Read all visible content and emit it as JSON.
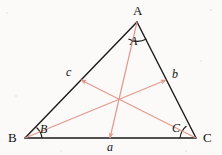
{
  "figure": {
    "background_color": "#fbfaf8",
    "stroke_color": "#1a1a1a",
    "median_color": "#e09a8e",
    "label_color": "#111111",
    "median_label_color": "#111111"
  },
  "vertices": {
    "A": {
      "label": "A",
      "x": 137,
      "y": 22,
      "label_x": 133,
      "label_y": 4
    },
    "B": {
      "label": "B",
      "x": 25,
      "y": 138,
      "label_x": 8,
      "label_y": 131
    },
    "C": {
      "label": "C",
      "x": 196,
      "y": 138,
      "label_x": 203,
      "label_y": 131
    }
  },
  "sides": {
    "a": {
      "label": "a",
      "from": "B",
      "to": "C",
      "label_x": 107,
      "label_y": 141
    },
    "b": {
      "label": "b",
      "from": "A",
      "to": "C",
      "label_x": 172,
      "label_y": 68
    },
    "c": {
      "label": "c",
      "from": "A",
      "to": "B",
      "label_x": 66,
      "label_y": 66
    }
  },
  "medians": {
    "from_A": {
      "label": "A",
      "label_x": 130,
      "label_y": 35,
      "start_x": 137,
      "start_y": 22,
      "end_x": 110,
      "end_y": 138
    },
    "from_B": {
      "label": "B",
      "label_x": 40,
      "label_y": 123,
      "start_x": 25,
      "start_y": 138,
      "end_x": 166,
      "end_y": 80
    },
    "from_C": {
      "label": "C",
      "label_x": 172,
      "label_y": 122,
      "start_x": 196,
      "start_y": 138,
      "end_x": 81,
      "end_y": 80
    }
  },
  "centroid": {
    "x": 119,
    "y": 98
  },
  "angle_arcs": {
    "A": "arc-at-vertex-a",
    "B": "arc-at-vertex-b",
    "C": "arc-at-vertex-c"
  }
}
